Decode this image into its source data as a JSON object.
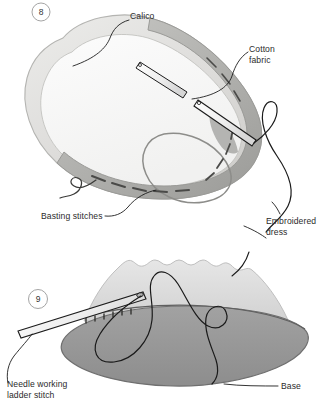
{
  "page": {
    "background": "#ffffff",
    "width": 321,
    "height": 414,
    "type": "instructional-illustration"
  },
  "figures": [
    {
      "number": "8",
      "name": "figure-8-calico-cotton-basting",
      "description": "Oval padded shape with calico lining, cotton fabric band and a threaded needle",
      "labels": [
        {
          "key": "calico",
          "text": "Calico"
        },
        {
          "key": "cotton",
          "text": "Cotton\nfabric"
        },
        {
          "key": "basting",
          "text": "Basting stitches"
        },
        {
          "key": "embroidered",
          "text": "Embroidered\ndress"
        }
      ]
    },
    {
      "number": "9",
      "name": "figure-9-ladder-stitch-base",
      "description": "Gathered skirt attached to an oval base with a needle working ladder stitch",
      "labels": [
        {
          "key": "needle",
          "text": "Needle working\nladder stitch"
        },
        {
          "key": "base",
          "text": "Base"
        }
      ]
    }
  ],
  "labels": {
    "calico": "Calico",
    "cotton_fabric": "Cotton\nfabric",
    "basting_stitches": "Basting stitches",
    "embroidered_dress": "Embroidered\ndress",
    "needle_ladder_stitch": "Needle working\nladder stitch",
    "base": "Base"
  },
  "step_numbers": {
    "first": "8",
    "second": "9"
  },
  "colors": {
    "background": "#ffffff",
    "ink": "#2b2b2b",
    "leader_line": "#1d1d1d",
    "thread": "#1a1a1a",
    "calico_light": "#e8e8e6",
    "calico_edge": "#bdbdbb",
    "fabric_band": "#b9b9b7",
    "fabric_band_dark": "#a3a3a1",
    "skirt_light": "#dedede",
    "base_gray": "#989898",
    "base_edge": "#6f6f6f",
    "needle_fill": "#f2f2f2",
    "needle_stroke": "#1c1c1c",
    "step_circle_stroke": "#9a9a9a"
  }
}
